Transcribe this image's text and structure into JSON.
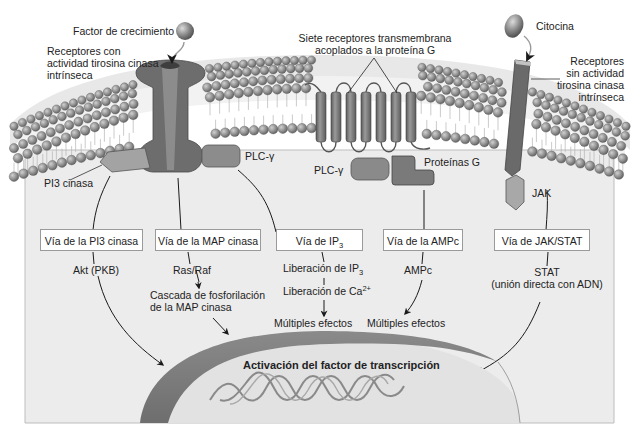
{
  "figure": {
    "extracellular_labels": {
      "growth_factor": "Factor de crecimiento",
      "rtk_receptor": [
        "Receptores con",
        "actividad tirosina cinasa",
        "intrínseca"
      ],
      "gpcr_receptor": [
        "Siete receptores transmembrana",
        "acoplados a la proteína G"
      ],
      "cytokine": "Citocina",
      "non_rtk_receptor": [
        "Receptores",
        "sin actividad",
        "tirosina cinasa",
        "intrínseca"
      ]
    },
    "membrane_proteins": {
      "pi3k": "PI3 cinasa",
      "plc_gamma_1": "PLC-γ",
      "plc_gamma_2": "PLC-γ",
      "g_proteins": "Proteínas G",
      "jak": "JAK"
    },
    "pathways": [
      {
        "label": "Vía de la PI3 cinasa",
        "steps": [
          "Akt (PKB)"
        ]
      },
      {
        "label": "Vía de la MAP cinasa",
        "steps": [
          "Ras/Raf",
          "Cascada de fosforilación",
          "de la MAP cinasa"
        ]
      },
      {
        "label_prefix": "Vía de IP",
        "label_sub": "3",
        "steps_ip3_prefix": "Liberación de IP",
        "steps_ip3_sub": "3",
        "steps_ca_prefix": "Liberación de Ca",
        "steps_ca_sup": "2+",
        "outcome": "Múltiples efectos"
      },
      {
        "label": "Vía de la AMPc",
        "steps": [
          "AMPc"
        ],
        "outcome": "Múltiples efectos"
      },
      {
        "label": "Vía de JAK/STAT",
        "steps": [
          "STAT",
          "(unión directa con ADN)"
        ]
      }
    ],
    "nucleus": {
      "title": "Activación del factor de transcripción"
    },
    "colors": {
      "cytoplasm": "#ececec",
      "membrane_head": "#8e8e8e",
      "receptor": "#6f6f6f",
      "protein_light": "#a9a9a9",
      "nuclear_envelope": "#7d7d7d",
      "nucleoplasm": "#e3e3e3"
    }
  }
}
